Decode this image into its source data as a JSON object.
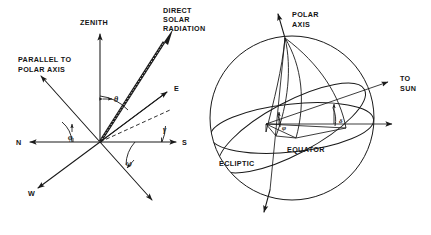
{
  "figure": {
    "background_color": "#ffffff",
    "line_color": "#1a1a1a",
    "panels": 2
  },
  "left_panel": {
    "name": "horizon-coordinate-diagram",
    "labels": {
      "zenith": "ZENITH",
      "direct_solar_radiation_line1": "DIRECT",
      "direct_solar_radiation_line2": "SOLAR",
      "direct_solar_radiation_line3": "RADIATION",
      "parallel_polar_line1": "PARALLEL TO",
      "parallel_polar_line2": "POLAR AXIS",
      "north": "N",
      "south": "S",
      "east": "E",
      "west": "W"
    },
    "angles": {
      "theta": "θ",
      "gamma": "γ",
      "omega": "ω",
      "phi": "φ"
    }
  },
  "right_panel": {
    "name": "celestial-sphere-diagram",
    "labels": {
      "polar_axis_line1": "POLAR",
      "polar_axis_line2": "AXIS",
      "to_sun_line1": "TO",
      "to_sun_line2": "SUN",
      "equator": "EQUATOR",
      "ecliptic": "ECLIPTIC"
    },
    "angles": {
      "phi": "φ",
      "delta": "δ"
    }
  }
}
